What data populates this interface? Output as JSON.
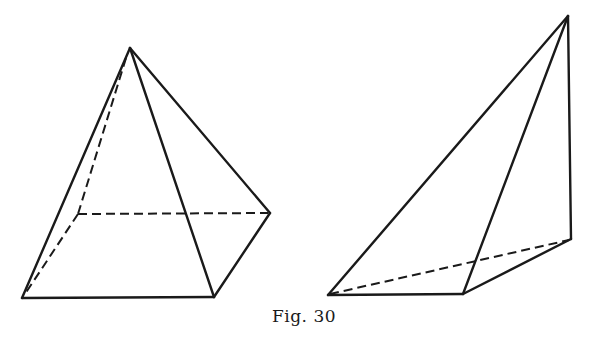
{
  "figure": {
    "caption": "Fig. 30",
    "line_color": "#1a1a1a",
    "background": "#ffffff"
  },
  "shapes": [
    {
      "name": "square-pyramid",
      "vertices": {
        "apex": [
          130,
          48
        ],
        "front_left": [
          22,
          298
        ],
        "front_right": [
          214,
          297
        ],
        "back_right": [
          270,
          213
        ],
        "back_left": [
          78,
          214
        ]
      },
      "solid_edges": [
        [
          "apex",
          "front_left"
        ],
        [
          "apex",
          "front_right"
        ],
        [
          "apex",
          "back_right"
        ],
        [
          "front_left",
          "front_right"
        ],
        [
          "front_right",
          "back_right"
        ]
      ],
      "dashed_edges": [
        [
          "apex",
          "back_left"
        ],
        [
          "back_left",
          "back_right"
        ],
        [
          "back_left",
          "front_left"
        ]
      ]
    },
    {
      "name": "tetrahedron",
      "vertices": {
        "apex": [
          568,
          16
        ],
        "base_left": [
          328,
          295
        ],
        "base_middle": [
          463,
          294
        ],
        "base_back": [
          571,
          239
        ]
      },
      "solid_edges": [
        [
          "apex",
          "base_left"
        ],
        [
          "apex",
          "base_middle"
        ],
        [
          "apex",
          "base_back"
        ],
        [
          "base_left",
          "base_middle"
        ],
        [
          "base_middle",
          "base_back"
        ]
      ],
      "dashed_edges": [
        [
          "base_left",
          "base_back"
        ]
      ]
    }
  ]
}
